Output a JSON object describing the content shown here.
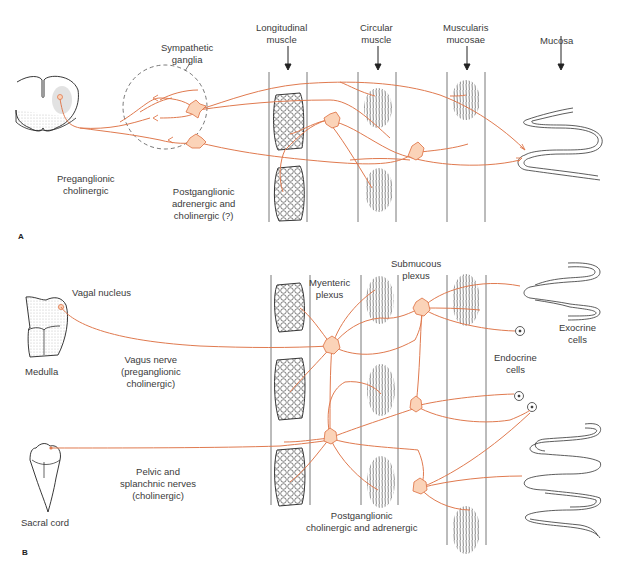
{
  "colors": {
    "nerve": "#e07a4f",
    "neuron_fill": "#fbd3b8",
    "outline": "#333333",
    "label_text": "#3a3a3a",
    "ganglion_dash": "#555555"
  },
  "panel_a": {
    "letter": "A",
    "labels": {
      "longitudinal_muscle": "Longitudinal\nmuscle",
      "circular_muscle": "Circular\nmuscle",
      "muscularis_mucosae": "Muscularis\nmucosae",
      "mucosa": "Mucosa",
      "sympathetic_ganglia": "Sympathetic\nganglia",
      "preganglionic": "Preganglionic\ncholinergic",
      "postganglionic": "Postganglionic\nadrenergic and\ncholinergic (?)"
    }
  },
  "panel_b": {
    "letter": "B",
    "labels": {
      "vagal_nucleus": "Vagal nucleus",
      "medulla": "Medulla",
      "vagus_nerve": "Vagus nerve\n(preganglionic\ncholinergic)",
      "sacral_cord": "Sacral cord",
      "pelvic_nerves": "Pelvic and\nsplanchnic nerves\n(cholinergic)",
      "myenteric_plexus": "Myenteric\nplexus",
      "submucous_plexus": "Submucous\nplexus",
      "exocrine_cells": "Exocrine\ncells",
      "endocrine_cells": "Endocrine\ncells",
      "postganglionic": "Postganglionic\ncholinergic and adrenergic"
    }
  }
}
